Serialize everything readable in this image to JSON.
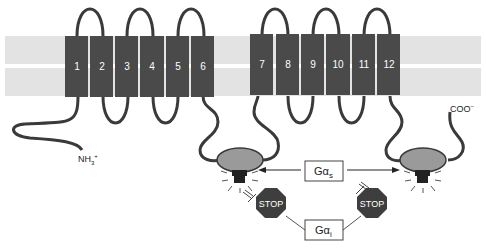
{
  "diagram": {
    "helices_group1": [
      "1",
      "2",
      "3",
      "4",
      "5",
      "6"
    ],
    "helices_group2": [
      "7",
      "8",
      "9",
      "10",
      "11",
      "12"
    ],
    "n_terminus": "NH3+",
    "n_terminus_main": "NH",
    "n_terminus_sub": "3",
    "n_terminus_sup": "+",
    "c_terminus_main": "COO",
    "c_terminus_sup": "−",
    "gas_label_main": "Gα",
    "gas_label_sub": "s",
    "gai_label_main": "Gα",
    "gai_label_sub": "i",
    "stop_left": "STOP",
    "stop_right": "STOP",
    "colors": {
      "membrane": "#e3e3e3",
      "helix": "#4a4a4a",
      "helix_text": "#ffffff",
      "loop": "#3a3a3a",
      "catalytic_domain": "#9a9a9a",
      "stop_sign": "#3e3e3e"
    }
  }
}
